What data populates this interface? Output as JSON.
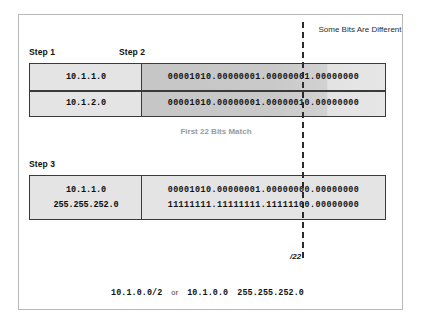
{
  "figure": {
    "steps": {
      "step1_label": "Step 1",
      "step2_label": "Step 2",
      "step3_label": "Step 3"
    },
    "annotations": {
      "some_bits_different": "Some Bits Are\nDifferent",
      "first_bits_match": "First 22 Bits Match",
      "prefix_marker": "/22"
    },
    "table1": {
      "rows": [
        {
          "address": "10.1.1.0",
          "bits": "00001010.00000001.00000001.00000000"
        },
        {
          "address": "10.1.2.0",
          "bits": "00001010.00000001.00000010.00000000"
        }
      ]
    },
    "table3": {
      "rows": [
        {
          "address": "10.1.1.0",
          "bits": "00001010.00000001.00000000.00000000"
        },
        {
          "address": "255.255.252.0",
          "bits": "11111111.11111111.11111100.00000000"
        }
      ]
    },
    "summary": {
      "prefix_notation": "10.1.0.0/2",
      "conjunction": "or",
      "address": "10.1.0.0",
      "mask": "255.255.252.0"
    },
    "colors": {
      "frame_border": "#b9b9b9",
      "table_border": "#3a3a3a",
      "cell_light": "#e4e4e4",
      "cell_dark": "#c6c6c6",
      "dashed_line": "#2b2b2b",
      "caption_gray": "#9a9a9a",
      "text": "#111111"
    }
  }
}
